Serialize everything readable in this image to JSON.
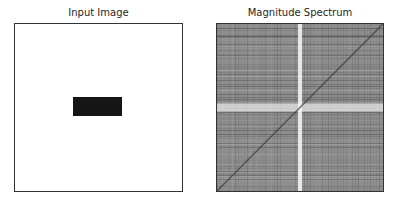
{
  "figure": {
    "panels": [
      {
        "title": "Input Image",
        "description": "White image with a centered black rectangle",
        "rectangle": {
          "x0": 0.35,
          "y0": 0.44,
          "x1": 0.64,
          "y1": 0.55,
          "color": "#151515"
        }
      },
      {
        "title": "Magnitude Spectrum",
        "description": "Grayscale log-magnitude FFT spectrum with bright central cross and diagonal dark streak",
        "cross_x": 0.5,
        "cross_y": 0.5
      }
    ]
  }
}
